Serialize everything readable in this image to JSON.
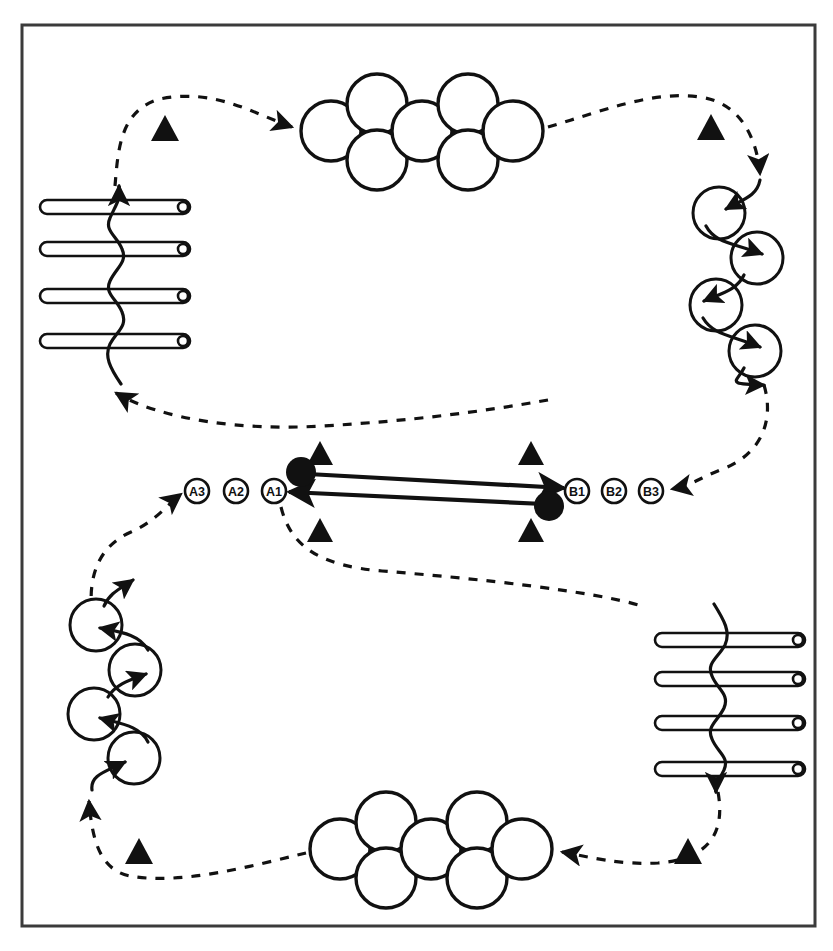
{
  "figure": {
    "kind": "cyclic-process-diagram",
    "border_color": "#3b3b3b",
    "stroke_color": "#111111",
    "fill_color": "#ffffff",
    "background": "#ffffff",
    "border": {
      "x": 22,
      "y": 25,
      "width": 793,
      "height": 901
    }
  },
  "labels": {
    "left_nodes": [
      {
        "id": "A3",
        "text": "A3",
        "cx": 197,
        "cy": 491
      },
      {
        "id": "A2",
        "text": "A2",
        "cx": 236,
        "cy": 491
      },
      {
        "id": "A1",
        "text": "A1",
        "cx": 274,
        "cy": 491
      }
    ],
    "right_nodes": [
      {
        "id": "B1",
        "text": "B1",
        "cx": 577,
        "cy": 491
      },
      {
        "id": "B2",
        "text": "B2",
        "cx": 614,
        "cy": 491
      },
      {
        "id": "B3",
        "text": "B3",
        "cx": 651,
        "cy": 491
      }
    ],
    "node_radius": 12
  },
  "center_track": {
    "dot_left": {
      "cx": 301,
      "cy": 472,
      "r": 15
    },
    "dot_right": {
      "cx": 549,
      "cy": 506,
      "r": 15
    },
    "arrow_forward": {
      "x1": 311,
      "y1": 475,
      "x2": 566,
      "y2": 489,
      "direction": "left-to-right"
    },
    "arrow_backward": {
      "x1": 540,
      "y1": 504,
      "x2": 286,
      "y2": 492,
      "direction": "right-to-left"
    },
    "triangles": [
      {
        "cx": 320,
        "cy": 453,
        "size": 17
      },
      {
        "cx": 531,
        "cy": 453,
        "size": 17
      },
      {
        "cx": 320,
        "cy": 530,
        "size": 17
      },
      {
        "cx": 531,
        "cy": 530,
        "size": 17
      }
    ]
  },
  "corner_triangles": [
    {
      "name": "triangle-top-left",
      "cx": 165,
      "cy": 129,
      "size": 19
    },
    {
      "name": "triangle-top-right",
      "cx": 711,
      "cy": 128,
      "size": 19
    },
    {
      "name": "triangle-bottom-left",
      "cx": 139,
      "cy": 851,
      "size": 19
    },
    {
      "name": "triangle-bottom-right",
      "cx": 688,
      "cy": 851,
      "size": 19
    }
  ],
  "rod_groups": [
    {
      "name": "rods-top-left",
      "x_start": 40,
      "x_end": 190,
      "rod_height": 14,
      "rods_y": [
        207,
        249,
        296,
        341
      ],
      "cap_side": "right",
      "weave_direction": "upward"
    },
    {
      "name": "rods-bottom-right",
      "x_start": 655,
      "x_end": 805,
      "rod_height": 14,
      "rods_y": [
        640,
        679,
        723,
        769
      ],
      "cap_side": "right",
      "weave_direction": "downward"
    }
  ],
  "circle_chains": [
    {
      "name": "circle-chain-top-right",
      "radius": 26,
      "direction": "descending",
      "circles": [
        {
          "cx": 719,
          "cy": 213
        },
        {
          "cx": 756,
          "cy": 258
        },
        {
          "cx": 716,
          "cy": 305
        },
        {
          "cx": 755,
          "cy": 351
        }
      ]
    },
    {
      "name": "circle-chain-bottom-left",
      "radius": 26,
      "direction": "ascending",
      "circles": [
        {
          "cx": 96,
          "cy": 625
        },
        {
          "cx": 135,
          "cy": 670
        },
        {
          "cx": 94,
          "cy": 714
        },
        {
          "cx": 134,
          "cy": 758
        }
      ]
    }
  ],
  "circle_clusters": [
    {
      "name": "circle-cluster-top",
      "radius": 30,
      "circles": [
        {
          "cx": 331,
          "cy": 131
        },
        {
          "cx": 376,
          "cy": 104
        },
        {
          "cx": 376,
          "cy": 159
        },
        {
          "cx": 421,
          "cy": 131
        },
        {
          "cx": 466,
          "cy": 104
        },
        {
          "cx": 466,
          "cy": 159
        },
        {
          "cx": 511,
          "cy": 131
        }
      ]
    },
    {
      "name": "circle-cluster-bottom",
      "radius": 30,
      "circles": [
        {
          "cx": 340,
          "cy": 849
        },
        {
          "cx": 385,
          "cy": 822
        },
        {
          "cx": 385,
          "cy": 877
        },
        {
          "cx": 430,
          "cy": 849
        },
        {
          "cx": 475,
          "cy": 822
        },
        {
          "cx": 475,
          "cy": 877
        },
        {
          "cx": 520,
          "cy": 849
        }
      ]
    }
  ],
  "dashed_paths": [
    {
      "name": "dashed-rods-to-cluster-top",
      "d": "M 115 186 C 118 150 120 110 160 99 C 215 88 250 115 295 128",
      "arrow_at": "end"
    },
    {
      "name": "dashed-cluster-top-to-chain-right",
      "d": "M 545 127 C 600 112 650 92 700 97 C 740 101 756 140 760 176",
      "arrow_at": "end"
    },
    {
      "name": "dashed-chain-right-to-center",
      "d": "M 762 383 C 772 420 760 455 720 472 C 700 480 690 486 668 489",
      "arrow_at": "end"
    },
    {
      "name": "dashed-center-to-rods",
      "d": "M 113 392 C 160 418 240 430 320 425 C 410 420 480 412 545 400",
      "arrow_at": "start"
    },
    {
      "name": "dashed-a1-to-bottom-right",
      "d": "M 281 507 C 290 545 320 565 380 570 C 480 578 590 590 640 605",
      "arrow_at": "none"
    },
    {
      "name": "dashed-rods-bottom-to-cluster-bottom",
      "d": "M 718 790 C 724 828 712 858 660 862 C 620 864 590 856 560 852",
      "arrow_at": "end"
    },
    {
      "name": "dashed-cluster-bottom-to-chain-left",
      "d": "M 308 852 C 250 866 180 884 130 875 C 100 869 92 840 89 803",
      "arrow_at": "end"
    },
    {
      "name": "dashed-chain-left-to-a3",
      "d": "M 92 616 C 88 580 96 548 130 533 C 155 522 168 505 180 494",
      "arrow_at": "end"
    }
  ]
}
